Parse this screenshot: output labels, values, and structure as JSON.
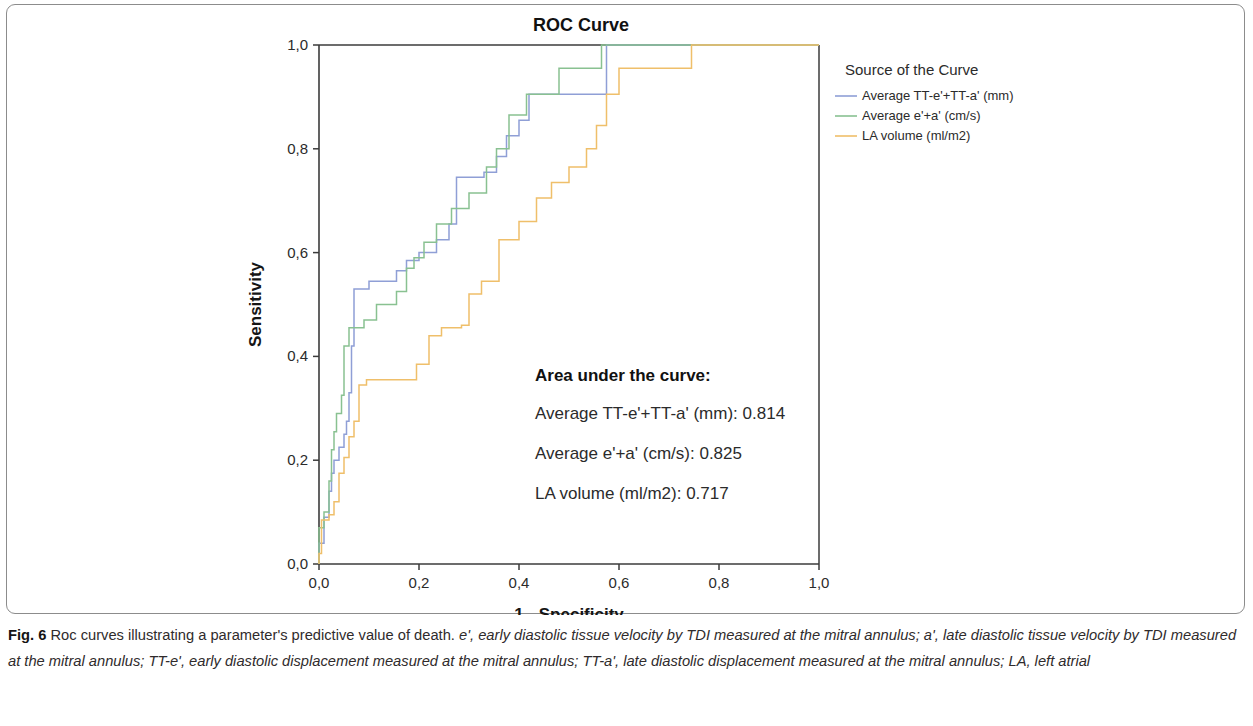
{
  "figure": {
    "caption_label": "Fig. 6",
    "caption_lead": "Roc curves illustrating a parameter's predictive value of death.",
    "caption_rest": "e', early diastolic tissue velocity by TDI measured at the mitral annulus; a', late diastolic tissue velocity by TDI measured at the mitral annulus; TT-e', early diastolic displacement measured at the mitral annulus; TT-a', late diastolic displacement measured at the mitral annulus; LA, left atrial"
  },
  "legend": {
    "title": "Source of the Curve",
    "entries": [
      {
        "label": "Average TT-e'+TT-a' (mm)",
        "color": "#8f9fd6"
      },
      {
        "label": "Average e'+a' (cm/s)",
        "color": "#89c191"
      },
      {
        "label": "LA volume (ml/m2)",
        "color": "#efbf6a"
      }
    ]
  },
  "auc_box": {
    "heading": "Area under the curve:",
    "rows": [
      "Average TT-e'+TT-a' (mm): 0.814",
      "Average e'+a' (cm/s): 0.825",
      "LA volume (ml/m2): 0.717"
    ]
  },
  "chart_data": {
    "type": "line",
    "title": "ROC Curve",
    "xlabel": "1 - Specificity",
    "ylabel": "Sensitivity",
    "xlim": [
      0,
      1
    ],
    "ylim": [
      0,
      1
    ],
    "grid": false,
    "legend_position": "right",
    "xticks": [
      0,
      0.2,
      0.4,
      0.6,
      0.8,
      1.0
    ],
    "yticks": [
      0,
      0.2,
      0.4,
      0.6,
      0.8,
      1.0
    ],
    "xticklabels": [
      "0,0",
      "0,2",
      "0,4",
      "0,6",
      "0,8",
      "1,0"
    ],
    "yticklabels": [
      "0,0",
      "0,2",
      "0,4",
      "0,6",
      "0,8",
      "1,0"
    ],
    "series": [
      {
        "name": "Average TT-e'+TT-a' (mm)",
        "color": "#8f9fd6",
        "auc": 0.814,
        "x": [
          0.0,
          0.0,
          0.01,
          0.01,
          0.02,
          0.02,
          0.025,
          0.025,
          0.03,
          0.03,
          0.04,
          0.04,
          0.05,
          0.05,
          0.055,
          0.055,
          0.06,
          0.06,
          0.065,
          0.065,
          0.07,
          0.07,
          0.1,
          0.1,
          0.155,
          0.155,
          0.175,
          0.175,
          0.2,
          0.2,
          0.235,
          0.235,
          0.26,
          0.26,
          0.275,
          0.275,
          0.33,
          0.33,
          0.355,
          0.355,
          0.375,
          0.375,
          0.4,
          0.4,
          0.42,
          0.42,
          0.575,
          0.575,
          1.0
        ],
        "y": [
          0.0,
          0.04,
          0.04,
          0.09,
          0.09,
          0.14,
          0.14,
          0.175,
          0.175,
          0.2,
          0.2,
          0.225,
          0.225,
          0.25,
          0.25,
          0.275,
          0.275,
          0.33,
          0.33,
          0.42,
          0.42,
          0.53,
          0.53,
          0.545,
          0.545,
          0.565,
          0.565,
          0.585,
          0.585,
          0.6,
          0.6,
          0.625,
          0.625,
          0.655,
          0.655,
          0.745,
          0.745,
          0.755,
          0.755,
          0.785,
          0.785,
          0.825,
          0.825,
          0.855,
          0.855,
          0.905,
          0.905,
          1.0,
          1.0
        ]
      },
      {
        "name": "Average e'+a' (cm/s)",
        "color": "#89c191",
        "auc": 0.825,
        "x": [
          0.0,
          0.0,
          0.01,
          0.01,
          0.02,
          0.02,
          0.025,
          0.025,
          0.03,
          0.03,
          0.035,
          0.035,
          0.045,
          0.045,
          0.05,
          0.05,
          0.06,
          0.06,
          0.09,
          0.09,
          0.115,
          0.115,
          0.155,
          0.155,
          0.175,
          0.175,
          0.19,
          0.19,
          0.21,
          0.21,
          0.235,
          0.235,
          0.265,
          0.265,
          0.3,
          0.3,
          0.335,
          0.335,
          0.355,
          0.355,
          0.38,
          0.38,
          0.415,
          0.415,
          0.48,
          0.48,
          0.565,
          0.565,
          1.0
        ],
        "y": [
          0.0,
          0.07,
          0.07,
          0.1,
          0.1,
          0.16,
          0.16,
          0.22,
          0.22,
          0.255,
          0.255,
          0.29,
          0.29,
          0.325,
          0.325,
          0.42,
          0.42,
          0.455,
          0.455,
          0.47,
          0.47,
          0.5,
          0.5,
          0.525,
          0.525,
          0.57,
          0.57,
          0.59,
          0.59,
          0.62,
          0.62,
          0.655,
          0.655,
          0.685,
          0.685,
          0.715,
          0.715,
          0.765,
          0.765,
          0.8,
          0.8,
          0.865,
          0.865,
          0.905,
          0.905,
          0.955,
          0.955,
          1.0,
          1.0
        ]
      },
      {
        "name": "LA volume (ml/m2)",
        "color": "#efbf6a",
        "auc": 0.717,
        "x": [
          0.0,
          0.0,
          0.005,
          0.005,
          0.02,
          0.02,
          0.03,
          0.03,
          0.04,
          0.04,
          0.05,
          0.05,
          0.06,
          0.06,
          0.07,
          0.07,
          0.08,
          0.08,
          0.095,
          0.095,
          0.195,
          0.195,
          0.22,
          0.22,
          0.245,
          0.245,
          0.285,
          0.285,
          0.3,
          0.3,
          0.325,
          0.325,
          0.36,
          0.36,
          0.4,
          0.4,
          0.435,
          0.435,
          0.465,
          0.465,
          0.5,
          0.5,
          0.535,
          0.535,
          0.555,
          0.555,
          0.575,
          0.575,
          0.6,
          0.6,
          0.745,
          0.745,
          1.0
        ],
        "y": [
          0.0,
          0.02,
          0.02,
          0.085,
          0.085,
          0.095,
          0.095,
          0.12,
          0.12,
          0.175,
          0.175,
          0.205,
          0.205,
          0.245,
          0.245,
          0.275,
          0.275,
          0.345,
          0.345,
          0.355,
          0.355,
          0.385,
          0.385,
          0.44,
          0.44,
          0.455,
          0.455,
          0.46,
          0.46,
          0.52,
          0.52,
          0.545,
          0.545,
          0.625,
          0.625,
          0.66,
          0.66,
          0.705,
          0.705,
          0.735,
          0.735,
          0.765,
          0.765,
          0.8,
          0.8,
          0.845,
          0.845,
          0.905,
          0.905,
          0.955,
          0.955,
          1.0,
          1.0
        ]
      }
    ]
  }
}
